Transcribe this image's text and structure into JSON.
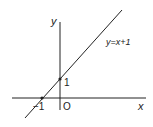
{
  "diagram": {
    "type": "coordinate-graph",
    "axes": {
      "x_label": "x",
      "y_label": "y",
      "origin_label": "O"
    },
    "line": {
      "equation_label": "y=x+1",
      "slope": 1,
      "intercept": 1
    },
    "marked_points": [
      {
        "label": "1",
        "x": 0,
        "y": 1,
        "description": "y-intercept"
      },
      {
        "label": "−1",
        "x": -1,
        "y": 0,
        "description": "x-intercept"
      }
    ],
    "colors": {
      "line": "#222222",
      "background": "#ffffff"
    }
  }
}
